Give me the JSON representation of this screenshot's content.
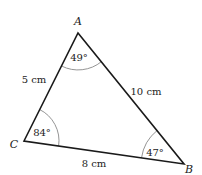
{
  "diagram": {
    "type": "triangle",
    "vertices": {
      "A": {
        "label": "A",
        "x": 78,
        "y": 33
      },
      "B": {
        "label": "B",
        "x": 184,
        "y": 164
      },
      "C": {
        "label": "C",
        "x": 24,
        "y": 141
      }
    },
    "angles": {
      "A": "49°",
      "B": "47°",
      "C": "84°"
    },
    "sides": {
      "AC": "5 cm",
      "AB": "10 cm",
      "CB": "8 cm"
    },
    "colors": {
      "stroke": "#1a1a1a",
      "arc": "#888888",
      "text": "#222222"
    }
  }
}
